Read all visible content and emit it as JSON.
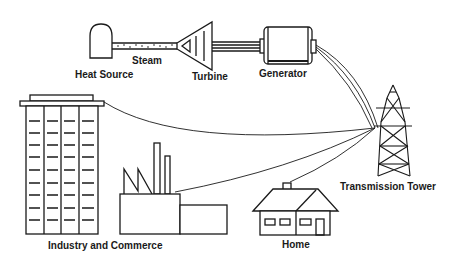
{
  "labels": {
    "heat_source": "Heat Source",
    "steam": "Steam",
    "turbine": "Turbine",
    "generator": "Generator",
    "transmission_tower": "Transmission Tower",
    "industry_commerce": "Industry and Commerce",
    "home": "Home"
  },
  "colors": {
    "stroke": "#1a1a1a",
    "background": "#ffffff"
  }
}
